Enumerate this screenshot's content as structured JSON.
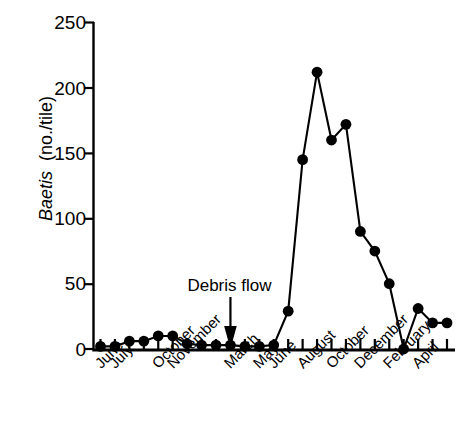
{
  "chart_data": {
    "type": "line",
    "title": "",
    "subtitle": "",
    "xlabel": "",
    "ylabel": "Baetis  (no./tile)",
    "ylabel_italic_part": "Baetis",
    "ylabel_roman_part": "(no./tile)",
    "ylim": [
      0,
      250
    ],
    "ytick_values": [
      0,
      50,
      100,
      150,
      200,
      250
    ],
    "ytick_labels": [
      "0",
      "50",
      "100",
      "150",
      "200",
      "250"
    ],
    "grid": false,
    "legend": "none",
    "marker": "filled-circle",
    "line_color": "#000000",
    "marker_color": "#000000",
    "categories": [
      "June",
      "July",
      "August",
      "September",
      "October",
      "November",
      "December",
      "January",
      "February",
      "March",
      "April",
      "May",
      "June",
      "July",
      "August",
      "September",
      "October",
      "November",
      "December",
      "January",
      "February",
      "March",
      "April",
      "May",
      "June"
    ],
    "xtick_labels_shown": [
      "June",
      "July",
      "October",
      "November",
      "March",
      "May",
      "June",
      "August",
      "October",
      "December",
      "February",
      "April"
    ],
    "xtick_label_indices": [
      0,
      1,
      4,
      5,
      9,
      11,
      12,
      14,
      16,
      18,
      20,
      22
    ],
    "values": [
      2,
      2,
      6,
      6,
      10,
      10,
      4,
      3,
      3,
      3,
      2,
      2,
      3,
      29,
      145,
      212,
      160,
      172,
      90,
      75,
      50,
      0,
      31,
      20,
      20
    ],
    "annotations": [
      {
        "text": "Debris flow",
        "type": "arrow-down",
        "points_at_category": "March",
        "points_at_index": 9,
        "value": 0
      }
    ]
  },
  "axes": {
    "y_tick_direction": "outward-left",
    "x_tick_direction": "upward",
    "spine_color": "#000000"
  }
}
